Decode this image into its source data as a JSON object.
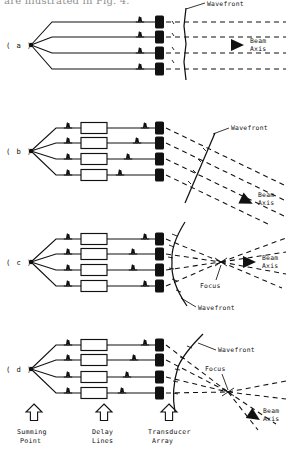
{
  "page": {
    "top_cut_text": "are illustrated in Fig. 4.",
    "background_color": "#ffffff",
    "ink_color": "#111111"
  },
  "figure": {
    "panels": [
      {
        "id": "a",
        "label": "( a )",
        "description": "No delay: plane wavefront, unsteered beam along axis",
        "wavefront_label": "Wavefront",
        "beam_axis_label_line1": "Beam",
        "beam_axis_label_line2": "Axis",
        "focus_label": null,
        "has_delay_lines": false,
        "wavefront_shape": "plane-vertical",
        "steered": false,
        "focused": false,
        "channels": 4
      },
      {
        "id": "b",
        "label": "( b )",
        "description": "Linear delay: tilted plane wavefront, steered beam",
        "wavefront_label": "Wavefront",
        "beam_axis_label_line1": "Beam",
        "beam_axis_label_line2": "Axis",
        "focus_label": null,
        "has_delay_lines": true,
        "wavefront_shape": "plane-tilted",
        "steered": true,
        "focused": false,
        "channels": 4
      },
      {
        "id": "c",
        "label": "( c )",
        "description": "Symmetric delay: curved wavefront focused on axis",
        "wavefront_label": "Wavefront",
        "beam_axis_label_line1": "Beam",
        "beam_axis_label_line2": "Axis",
        "focus_label": "Focus",
        "has_delay_lines": true,
        "wavefront_shape": "concave",
        "steered": false,
        "focused": true,
        "channels": 4
      },
      {
        "id": "d",
        "label": "( d )",
        "description": "Combined delay: curved tilted wavefront, steered and focused beam",
        "wavefront_label": "Wavefront",
        "beam_axis_label_line1": "Beam",
        "beam_axis_label_line2": "Axis",
        "focus_label": "Focus",
        "has_delay_lines": true,
        "wavefront_shape": "concave-tilted",
        "steered": true,
        "focused": true,
        "channels": 4
      }
    ],
    "legend": [
      {
        "icon": "up-arrow-icon",
        "line1": "Summing",
        "line2": "Point"
      },
      {
        "icon": "up-arrow-icon",
        "line1": "Delay",
        "line2": "Lines"
      },
      {
        "icon": "up-arrow-icon",
        "line1": "Transducer",
        "line2": "Array"
      }
    ]
  }
}
